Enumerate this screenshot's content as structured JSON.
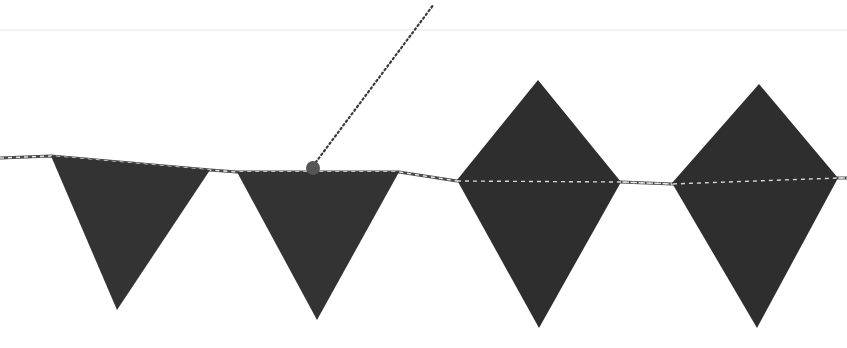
{
  "scene": {
    "description": "Bunting flags hanging on a striped twine string",
    "background_color": "#ffffff",
    "horizon_line": {
      "y": 30,
      "color": "#f2f2f2"
    },
    "string": {
      "color_dark": "#4a4a4a",
      "color_light": "#e8e8e8",
      "points": [
        [
          0,
          158
        ],
        [
          51,
          156
        ],
        [
          210,
          170
        ],
        [
          237,
          172
        ],
        [
          399,
          172
        ],
        [
          457,
          181
        ],
        [
          621,
          182
        ],
        [
          672,
          184
        ],
        [
          838,
          178
        ],
        [
          847,
          178
        ]
      ]
    },
    "hanging_cord": {
      "color": "#3a3a3a",
      "from": [
        313,
        166
      ],
      "to": [
        434,
        4
      ]
    },
    "attachment_dot": {
      "cx": 313,
      "cy": 168,
      "r": 7,
      "color": "#555555"
    },
    "flags": [
      {
        "shape": "triangle",
        "color": "#333333",
        "points": "51,156 210,170 117,310"
      },
      {
        "shape": "triangle",
        "color": "#333333",
        "points": "237,172 399,172 317,320"
      },
      {
        "shape": "diamond",
        "color": "#2e2e2e",
        "points": "538,80 621,182 539,328 457,180"
      },
      {
        "shape": "diamond",
        "color": "#2e2e2e",
        "points": "759,84 838,178 757,328 672,183"
      }
    ]
  }
}
